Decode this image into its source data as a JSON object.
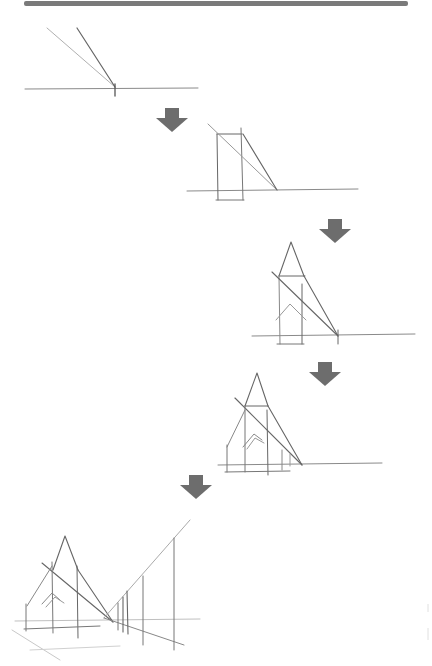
{
  "figure": {
    "kind": "step-by-step perspective sketch",
    "steps_count": 5,
    "colors": {
      "top_bar": "#7a7a7a",
      "arrow": "#6d6d6d",
      "pencil_dark": "#5a5a5a",
      "pencil_mid": "#8a8a8a",
      "pencil_light": "#bdbdbd",
      "background": "#ffffff"
    },
    "steps": [
      {
        "index": 1,
        "description": "Horizon line with vanishing point and two converging lines"
      },
      {
        "index": 2,
        "description": "Rectangle block with diagonal to vanishing point"
      },
      {
        "index": 3,
        "description": "Spire triangle added above block, roof shape inside"
      },
      {
        "index": 4,
        "description": "Church outline with side walls and roof"
      },
      {
        "index": 5,
        "description": "Church with receding fence posts toward vanishing point"
      }
    ],
    "arrows": [
      {
        "from_step": 1,
        "to_step": 2,
        "icon": "down-arrow-icon"
      },
      {
        "from_step": 2,
        "to_step": 3,
        "icon": "down-arrow-icon"
      },
      {
        "from_step": 3,
        "to_step": 4,
        "icon": "down-arrow-icon"
      },
      {
        "from_step": 4,
        "to_step": 5,
        "icon": "down-arrow-icon"
      }
    ]
  }
}
